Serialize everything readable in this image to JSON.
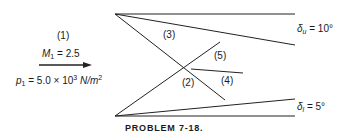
{
  "figure": {
    "caption": "PROBLEM 7-18.",
    "freestream": {
      "region_label": "(1)",
      "mach_symbol": "M",
      "mach_sub": "1",
      "mach_value": "= 2.5",
      "pressure_symbol": "p",
      "pressure_sub": "1",
      "pressure_value": "= 5.0 × 10",
      "pressure_exp": "3",
      "pressure_units": "N/m",
      "pressure_units_exp": "2"
    },
    "regions": {
      "r2": "(2)",
      "r3": "(3)",
      "r4": "(4)",
      "r5": "(5)"
    },
    "upper_wall": {
      "symbol": "δ",
      "sub": "u",
      "value": "= 10°"
    },
    "lower_wall": {
      "symbol": "δ",
      "sub": "l",
      "value": "= 5°"
    }
  }
}
